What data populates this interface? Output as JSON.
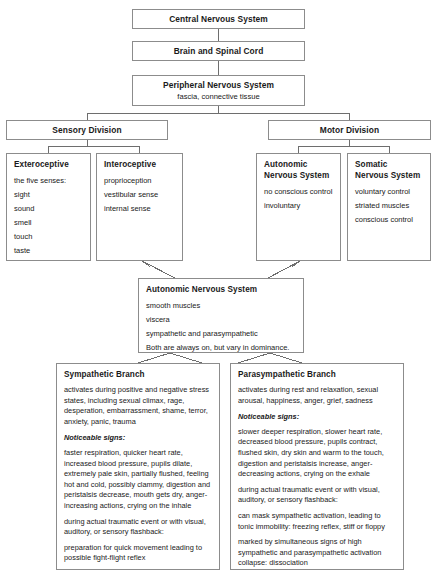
{
  "diagram": {
    "colors": {
      "border": "#8c8c8c",
      "text": "#1a1a1a",
      "background": "#ffffff",
      "connector": "#6e6e6e"
    },
    "nodes": {
      "central_nervous_system": {
        "title": "Central Nervous System"
      },
      "brain_and_spinal_cord": {
        "title": "Brain and Spinal Cord"
      },
      "peripheral_nervous_system": {
        "title": "Peripheral Nervous System",
        "subtitle": "fascia, connective tissue"
      },
      "sensory_division": {
        "title": "Sensory Division"
      },
      "motor_division": {
        "title": "Motor Division"
      },
      "exteroceptive": {
        "title": "Exteroceptive",
        "items": [
          "the five senses:",
          "sight",
          "sound",
          "smell",
          "touch",
          "taste"
        ]
      },
      "interoceptive": {
        "title": "Interoceptive",
        "items": [
          "proprioception",
          "vestibular sense",
          "internal sense"
        ]
      },
      "autonomic_nervous_system_motor": {
        "title": "Autonomic Nervous System",
        "items": [
          "no conscious control",
          "involuntary"
        ]
      },
      "somatic_nervous_system": {
        "title": "Somatic Nervous System",
        "items": [
          "voluntary control",
          "striated muscles",
          "conscious control"
        ]
      },
      "autonomic_nervous_system": {
        "title": "Autonomic Nervous System",
        "items": [
          "smooth muscles",
          "viscera",
          "sympathetic and parasympathetic",
          "Both are always on, but vary in dominance."
        ]
      },
      "sympathetic_branch": {
        "title": "Sympathetic Branch",
        "activation": "activates during positive and negative stress states, including sexual climax, rage, desperation, embarrassment, shame, terror, anxiety, panic, trauma",
        "signs_label": "Noticeable signs:",
        "signs": "faster respiration, quicker heart rate, increased blood pressure, pupils dilate, extremely pale skin, partially flushed, feeling hot and cold, possibly clammy, digestion and peristalsis decrease, mouth gets dry, anger-increasing actions, crying on the inhale",
        "flashback_label": "during actual traumatic event or with visual, auditory, or sensory flashback:",
        "flashback": "preparation for quick movement leading to possible fight-flight reflex"
      },
      "parasympathetic_branch": {
        "title": "Parasympathetic Branch",
        "activation": "activates during rest and relaxation, sexual arousal, happiness, anger, grief, sadness",
        "signs_label": "Noticeable signs:",
        "signs": "slower deeper respiration, slower heart rate, decreased blood pressure, pupils contract, flushed skin, dry skin and warm to the touch, digestion and peristalsis increase, anger-decreasing actions, crying on the exhale",
        "flashback_label": "during actual traumatic event or with visual, auditory, or sensory flashback:",
        "flashback": "can mask sympathetic activation, leading to tonic immobility: freezing reflex, stiff or floppy",
        "extra": "marked by simultaneous signs of high sympathetic and parasympathetic activation collapse: dissociation"
      }
    }
  }
}
